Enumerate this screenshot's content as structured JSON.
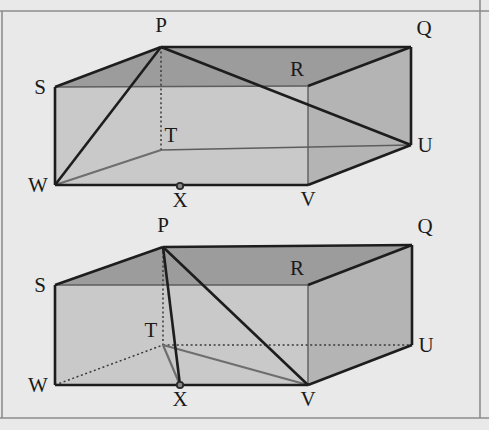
{
  "page": {
    "background_color": "#e9e9e9",
    "width": 489,
    "height": 430
  },
  "palette": {
    "top_face": "#9c9c9c",
    "front_face": "#c9c9c9",
    "right_face": "#b4b4b4",
    "inner_face": "#bdbdbd",
    "edge_solid": "#1d1d1d",
    "edge_thin": "#5d5d5d",
    "edge_gray": "#6e6e6e",
    "edge_dotted": "#3a3a3a",
    "frame": "#8d8d8d",
    "label": "#1a1a1a"
  },
  "frame": {
    "top_rule_y": 11,
    "bottom_rule_y": 418,
    "left_rule_x": 2,
    "right_rule_x": 480
  },
  "figures": [
    {
      "id": "figure-top",
      "name": "cuboid-top",
      "vertices": {
        "P": {
          "label": "P",
          "x": 161,
          "y": 47,
          "label_x": 161,
          "label_y": 32,
          "dot": false
        },
        "Q": {
          "label": "Q",
          "x": 411,
          "y": 47,
          "label_x": 424,
          "label_y": 35,
          "dot": false
        },
        "R": {
          "label": "R",
          "x": 308,
          "y": 86,
          "label_x": 297,
          "label_y": 76,
          "dot": false
        },
        "S": {
          "label": "S",
          "x": 55,
          "y": 87,
          "label_x": 40,
          "label_y": 94,
          "dot": false
        },
        "T": {
          "label": "T",
          "x": 161,
          "y": 150,
          "label_x": 171,
          "label_y": 142,
          "dot": false
        },
        "U": {
          "label": "U",
          "x": 411,
          "y": 145,
          "label_x": 425,
          "label_y": 152,
          "dot": false
        },
        "V": {
          "label": "V",
          "x": 308,
          "y": 185,
          "label_x": 308,
          "label_y": 206,
          "dot": false
        },
        "W": {
          "label": "W",
          "x": 55,
          "y": 185,
          "label_x": 38,
          "label_y": 192,
          "dot": false
        },
        "X": {
          "label": "X",
          "x": 180,
          "y": 186,
          "label_x": 180,
          "label_y": 207,
          "dot": true
        }
      },
      "faces": [
        {
          "name": "top-face",
          "style": "face-top",
          "points": "55,87 161,47 411,47 308,86"
        },
        {
          "name": "front-face",
          "style": "face-front",
          "points": "55,87 308,86 308,185 55,185"
        },
        {
          "name": "right-face",
          "style": "face-right",
          "points": "308,86 411,47 411,145 308,185"
        }
      ],
      "edges_solid": [
        {
          "name": "edge-S-P",
          "from": "S",
          "to": "P"
        },
        {
          "name": "edge-P-Q",
          "from": "P",
          "to": "Q"
        },
        {
          "name": "edge-Q-U",
          "from": "Q",
          "to": "U"
        },
        {
          "name": "edge-Q-R",
          "from": "Q",
          "to": "R"
        },
        {
          "name": "edge-S-W",
          "from": "S",
          "to": "W"
        },
        {
          "name": "edge-W-V",
          "from": "W",
          "to": "V"
        },
        {
          "name": "edge-V-U",
          "from": "V",
          "to": "U"
        },
        {
          "name": "edge-W-P",
          "from": "W",
          "to": "P"
        },
        {
          "name": "edge-P-U",
          "from": "P",
          "to": "U"
        }
      ],
      "edges_thin": [
        {
          "name": "edge-S-R",
          "from": "S",
          "to": "R"
        },
        {
          "name": "edge-R-V",
          "from": "R",
          "to": "V"
        },
        {
          "name": "edge-T-U",
          "from": "T",
          "to": "U"
        }
      ],
      "edges_gray": [
        {
          "name": "edge-W-T-interior",
          "from": "W",
          "to": "T"
        }
      ],
      "edges_dotted": [
        {
          "name": "edge-P-T-hidden",
          "from": "P",
          "to": "T"
        }
      ]
    },
    {
      "id": "figure-bottom",
      "name": "cuboid-bottom",
      "vertices": {
        "P": {
          "label": "P",
          "x": 163,
          "y": 247,
          "label_x": 163,
          "label_y": 232,
          "dot": false
        },
        "Q": {
          "label": "Q",
          "x": 412,
          "y": 245,
          "label_x": 425,
          "label_y": 233,
          "dot": false
        },
        "R": {
          "label": "R",
          "x": 308,
          "y": 285,
          "label_x": 297,
          "label_y": 275,
          "dot": false
        },
        "S": {
          "label": "S",
          "x": 55,
          "y": 285,
          "label_x": 40,
          "label_y": 292,
          "dot": false
        },
        "T": {
          "label": "T",
          "x": 163,
          "y": 345,
          "label_x": 151,
          "label_y": 337,
          "dot": false
        },
        "U": {
          "label": "U",
          "x": 412,
          "y": 345,
          "label_x": 426,
          "label_y": 352,
          "dot": false
        },
        "V": {
          "label": "V",
          "x": 308,
          "y": 385,
          "label_x": 308,
          "label_y": 406,
          "dot": false
        },
        "W": {
          "label": "W",
          "x": 55,
          "y": 385,
          "label_x": 38,
          "label_y": 392,
          "dot": false
        },
        "X": {
          "label": "X",
          "x": 180,
          "y": 385,
          "label_x": 180,
          "label_y": 406,
          "dot": true
        }
      },
      "faces": [
        {
          "name": "top-face",
          "style": "face-top",
          "points": "55,285 163,247 412,245 308,285"
        },
        {
          "name": "front-face",
          "style": "face-front",
          "points": "55,285 308,285 308,385 55,385"
        },
        {
          "name": "right-face",
          "style": "face-right",
          "points": "308,285 412,245 412,345 308,385"
        }
      ],
      "edges_solid": [
        {
          "name": "edge-S-P",
          "from": "S",
          "to": "P"
        },
        {
          "name": "edge-P-Q",
          "from": "P",
          "to": "Q"
        },
        {
          "name": "edge-Q-U",
          "from": "Q",
          "to": "U"
        },
        {
          "name": "edge-Q-R",
          "from": "Q",
          "to": "R"
        },
        {
          "name": "edge-S-W",
          "from": "S",
          "to": "W"
        },
        {
          "name": "edge-W-V",
          "from": "W",
          "to": "V"
        },
        {
          "name": "edge-V-U",
          "from": "V",
          "to": "U"
        },
        {
          "name": "edge-P-X",
          "from": "P",
          "to": "X"
        },
        {
          "name": "edge-P-V",
          "from": "P",
          "to": "V"
        }
      ],
      "edges_thin": [
        {
          "name": "edge-S-R",
          "from": "S",
          "to": "R"
        },
        {
          "name": "edge-R-V",
          "from": "R",
          "to": "V"
        }
      ],
      "edges_gray": [
        {
          "name": "edge-T-V-interior",
          "from": "T",
          "to": "V"
        },
        {
          "name": "edge-T-X-interior",
          "from": "T",
          "to": "X"
        }
      ],
      "edges_dotted": [
        {
          "name": "edge-P-T-hidden",
          "from": "P",
          "to": "T"
        },
        {
          "name": "edge-W-T-hidden",
          "from": "W",
          "to": "T"
        },
        {
          "name": "edge-T-U-hidden",
          "from": "T",
          "to": "U"
        }
      ]
    }
  ]
}
